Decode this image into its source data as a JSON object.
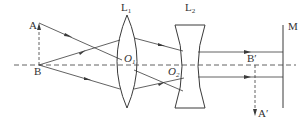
{
  "diagram": {
    "type": "optics-ray-diagram",
    "colors": {
      "line": "#3a3a3a",
      "background": "#ffffff"
    },
    "labels": {
      "object_top": "A",
      "object_base": "B",
      "lens1": {
        "main": "L",
        "sub": "1"
      },
      "lens2": {
        "main": "L",
        "sub": "2"
      },
      "center1": {
        "main": "O",
        "sub": "1"
      },
      "center2": {
        "main": "O",
        "sub": "2"
      },
      "image_base": "B′",
      "image_top": "A′",
      "screen": "M"
    },
    "elements": {
      "optical_axis": "dashed horizontal line",
      "object": "dashed arrow AB pointing up",
      "lens1": "convex lens L1",
      "lens2": "concave lens L2",
      "screen": "vertical line M",
      "image": "dashed arrow B′A′ pointing down"
    }
  }
}
